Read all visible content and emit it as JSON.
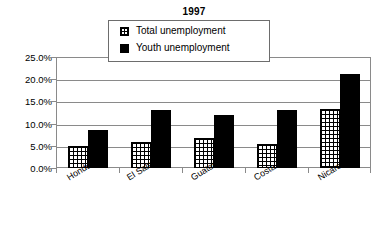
{
  "chart_data": {
    "type": "bar",
    "title": "1997",
    "xlabel": "",
    "ylabel": "",
    "ylim": [
      0,
      25
    ],
    "ytick_labels": [
      "0.0%",
      "5.0%",
      "10.0%",
      "15.0%",
      "20.0%",
      "25.0%"
    ],
    "ytick_values": [
      0,
      5,
      10,
      15,
      20,
      25
    ],
    "grid": true,
    "legend_position": "top-center",
    "categories": [
      "Honduras",
      "El Salvador",
      "Guatemala",
      "Costa Rica",
      "Nicaragua"
    ],
    "series": [
      {
        "name": "Total unemployment",
        "swatch": "grid-pattern-swatch",
        "color": "#ffffff",
        "values": [
          5.0,
          5.8,
          6.8,
          5.5,
          13.2
        ]
      },
      {
        "name": "Youth unemployment",
        "swatch": "solid-black-swatch",
        "color": "#000000",
        "values": [
          8.5,
          13.0,
          12.0,
          13.0,
          21.2
        ]
      }
    ]
  },
  "legend": {
    "items": [
      {
        "label": "Total unemployment"
      },
      {
        "label": "Youth unemployment"
      }
    ]
  }
}
